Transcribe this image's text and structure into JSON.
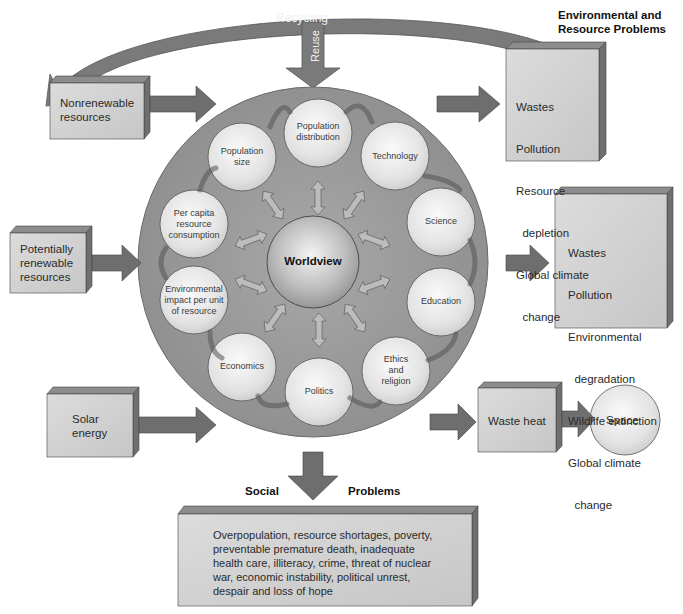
{
  "diagram": {
    "central_node": "Worldview",
    "ring_nodes": [
      {
        "label": "Population distribution",
        "lines": [
          "Population",
          "distribution"
        ]
      },
      {
        "label": "Technology",
        "lines": [
          "Technology"
        ]
      },
      {
        "label": "Science",
        "lines": [
          "Science"
        ]
      },
      {
        "label": "Education",
        "lines": [
          "Education"
        ]
      },
      {
        "label": "Ethics and religion",
        "lines": [
          "Ethics",
          "and",
          "religion"
        ]
      },
      {
        "label": "Politics",
        "lines": [
          "Politics"
        ]
      },
      {
        "label": "Economics",
        "lines": [
          "Economics"
        ]
      },
      {
        "label": "Environmental impact per unit of resource",
        "lines": [
          "Environmental",
          "impact per unit",
          "of resource"
        ]
      },
      {
        "label": "Per capita resource consumption",
        "lines": [
          "Per capita",
          "resource",
          "consumption"
        ]
      },
      {
        "label": "Population size",
        "lines": [
          "Population",
          "size"
        ]
      }
    ],
    "inputs": {
      "nonrenewable": {
        "lines": [
          "Nonrenewable",
          "resources"
        ]
      },
      "renewable": {
        "lines": [
          "Potentially",
          "renewable",
          "resources"
        ]
      },
      "solar": {
        "lines": [
          "Solar",
          "energy"
        ]
      }
    },
    "loops": {
      "recycling": "Recycling",
      "reuse": "Reuse"
    },
    "outputs": {
      "env_heading": [
        "Environmental and",
        "Resource Problems"
      ],
      "env_box_1": {
        "lines": [
          "Wastes",
          "Pollution",
          "Resource",
          "  depletion",
          "Global climate",
          "  change"
        ]
      },
      "env_box_2": {
        "lines": [
          "Wastes",
          "Pollution",
          "Environmental",
          "  degradation",
          "Wildlife extinction",
          "Global climate",
          "  change"
        ]
      },
      "waste_heat": "Waste heat",
      "space": "Space",
      "social_heading_left": "Social",
      "social_heading_right": "Problems",
      "social_box": {
        "lines": [
          "Overpopulation, resource shortages, poverty,",
          "preventable premature death, inadequate",
          "health care, illiteracy, crime, threat of nuclear",
          "war, economic instability, political unrest,",
          "despair and loss of hope"
        ]
      }
    },
    "colors": {
      "big_circle": "#9a9a9a",
      "box_face": "#d2d2d2",
      "box_top": "#8c8c8c",
      "box_side": "#7a7a7a",
      "arrow": "#6e6e6e",
      "small_circle": "#e8e8e8",
      "worldview": "#c4c4c4"
    }
  }
}
